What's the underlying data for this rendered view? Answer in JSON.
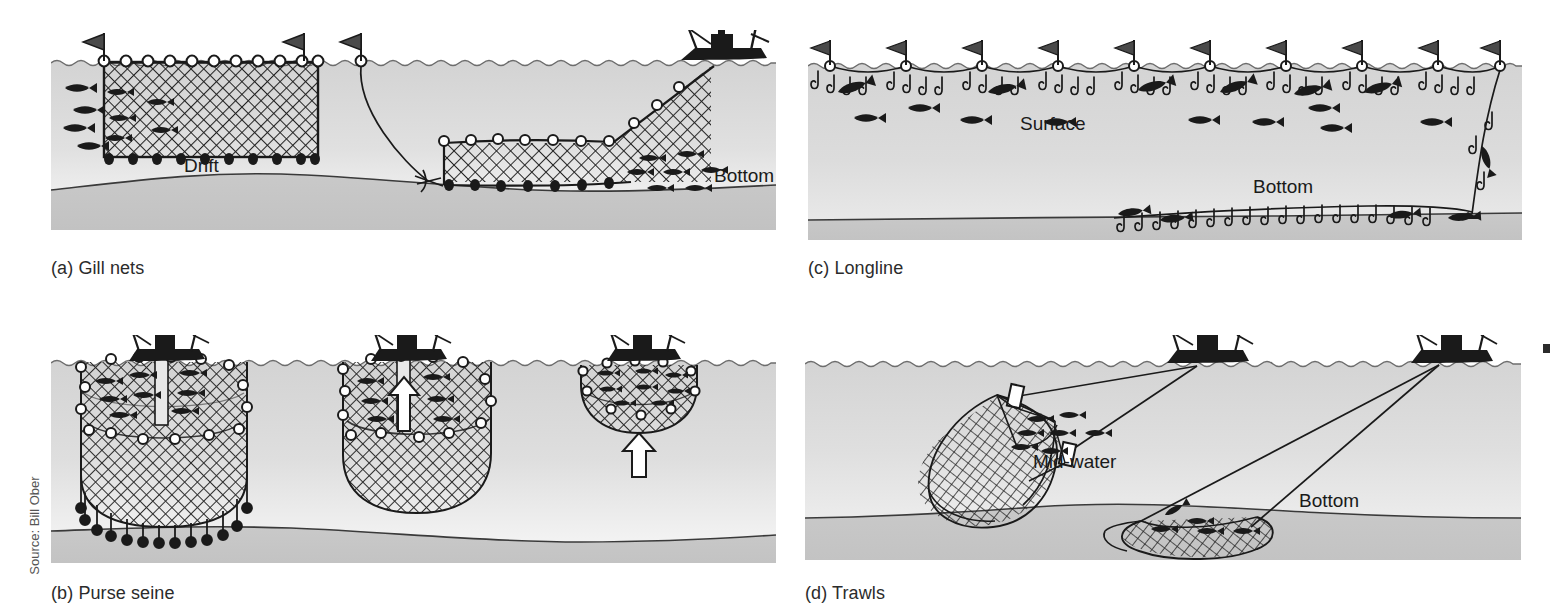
{
  "figure": {
    "source_credit": "Source: Bill Ober",
    "background_color": "#ffffff",
    "water_color_top": "#d2d2d2",
    "water_color_bottom": "#f2f2f2",
    "seabed_color": "#c7c7c7",
    "ink_color": "#1a1a1a",
    "caption_color": "#2b2b2b"
  },
  "panels": [
    {
      "id": "gill-nets",
      "caption": "(a) Gill nets",
      "letter": "a",
      "name": "Gill nets",
      "labels": [
        "Drift",
        "Bottom"
      ],
      "elements": {
        "drift_label": "Drift",
        "bottom_label": "Bottom"
      },
      "features": [
        "drift gill net suspended from surface floats with marker flags",
        "bottom-set gill net anchored on seafloor",
        "fishing vessel hauling net at right",
        "fish swimming toward nets"
      ]
    },
    {
      "id": "purse-seine",
      "caption": "(b) Purse seine",
      "letter": "b",
      "name": "Purse seine",
      "labels": [],
      "features": [
        "stage 1: net encircles school of fish, lead line hanging open",
        "stage 2: purse line drawn closed, net rising",
        "stage 3: closed purse of net with catch hauled to surface",
        "three fishing vessels, white up-arrows indicate hauling direction"
      ]
    },
    {
      "id": "longline",
      "caption": "(c) Longline",
      "letter": "c",
      "name": "Longline",
      "labels": [
        "Surface",
        "Bottom"
      ],
      "elements": {
        "surface_label": "Surface",
        "bottom_label": "Bottom"
      },
      "features": [
        "surface longline suspended from flagged buoys with baited hooks",
        "bottom longline laid along seafloor with baited hooks",
        "hooked and free-swimming fish"
      ]
    },
    {
      "id": "trawls",
      "caption": "(d) Trawls",
      "letter": "d",
      "name": "Trawls",
      "labels": [
        "Mid-water",
        "Bottom"
      ],
      "elements": {
        "midwater_label": "Mid-water",
        "bottom_label": "Bottom"
      },
      "features": [
        "mid-water trawl net towed between two warps with otter doors",
        "bottom trawl dragged along the seafloor",
        "two trawlers at the surface towing the nets"
      ]
    }
  ],
  "layout": {
    "columns": 2,
    "rows": 2,
    "panel_order": [
      "gill-nets",
      "longline",
      "purse-seine",
      "trawls"
    ]
  }
}
